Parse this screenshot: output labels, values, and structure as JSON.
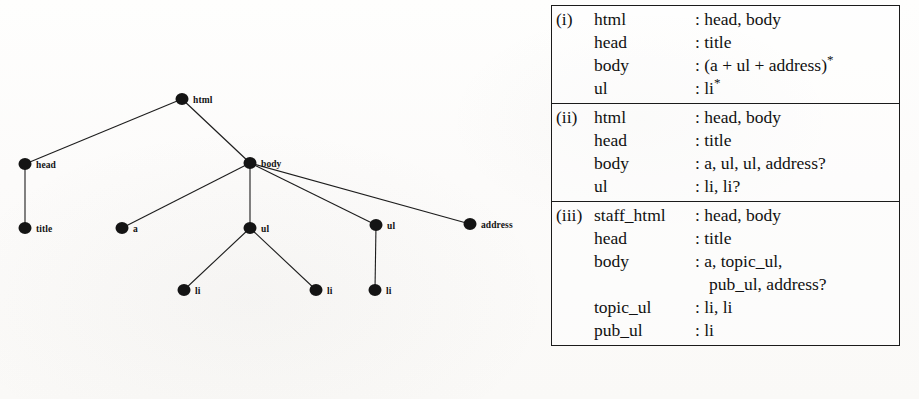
{
  "figure": {
    "tree": {
      "caption_nodes": "DOM tree for an HTML document",
      "nodes": [
        {
          "id": "html",
          "label": "html",
          "x": 182,
          "y": 99,
          "label_dx": 11,
          "label_dy": -4
        },
        {
          "id": "head",
          "label": "head",
          "x": 25,
          "y": 164,
          "label_dx": 11,
          "label_dy": -4
        },
        {
          "id": "body",
          "label": "body",
          "x": 250,
          "y": 163,
          "label_dx": 11,
          "label_dy": -4
        },
        {
          "id": "title",
          "label": "title",
          "x": 25,
          "y": 228,
          "label_dx": 11,
          "label_dy": -4
        },
        {
          "id": "a",
          "label": "a",
          "x": 122,
          "y": 228,
          "label_dx": 11,
          "label_dy": -4
        },
        {
          "id": "ul1",
          "label": "ul",
          "x": 250,
          "y": 228,
          "label_dx": 11,
          "label_dy": -4
        },
        {
          "id": "ul2",
          "label": "ul",
          "x": 376,
          "y": 225,
          "label_dx": 11,
          "label_dy": -4
        },
        {
          "id": "address",
          "label": "address",
          "x": 470,
          "y": 224,
          "label_dx": 11,
          "label_dy": -4
        },
        {
          "id": "li1",
          "label": "li",
          "x": 184,
          "y": 290,
          "label_dx": 11,
          "label_dy": -4
        },
        {
          "id": "li2",
          "label": "li",
          "x": 316,
          "y": 290,
          "label_dx": 11,
          "label_dy": -4
        },
        {
          "id": "li3",
          "label": "li",
          "x": 375,
          "y": 290,
          "label_dx": 11,
          "label_dy": -4
        }
      ],
      "edges": [
        {
          "from": "html",
          "to": "head"
        },
        {
          "from": "html",
          "to": "body"
        },
        {
          "from": "head",
          "to": "title"
        },
        {
          "from": "body",
          "to": "a"
        },
        {
          "from": "body",
          "to": "ul1"
        },
        {
          "from": "body",
          "to": "ul2"
        },
        {
          "from": "body",
          "to": "address"
        },
        {
          "from": "ul1",
          "to": "li1"
        },
        {
          "from": "ul1",
          "to": "li2"
        },
        {
          "from": "ul2",
          "to": "li3"
        }
      ],
      "node_radius": 6.5,
      "node_color": "#141414",
      "edge_color": "#1d1d1d",
      "edge_width": 1.1
    },
    "grammar": {
      "sections": [
        {
          "number": "(i)",
          "rows": [
            {
              "num": "(i)",
              "name": "html",
              "value": "head, body"
            },
            {
              "num": "",
              "name": "head",
              "value": "title"
            },
            {
              "num": "",
              "name": "body",
              "value": "(a + ul + address)*"
            },
            {
              "num": "",
              "name": "ul",
              "value": "li*"
            }
          ]
        },
        {
          "number": "(ii)",
          "rows": [
            {
              "num": "(ii)",
              "name": "html",
              "value": "head, body"
            },
            {
              "num": "",
              "name": "head",
              "value": "title"
            },
            {
              "num": "",
              "name": "body",
              "value": "a, ul, ul, address?"
            },
            {
              "num": "",
              "name": "ul",
              "value": "li, li?"
            }
          ]
        },
        {
          "number": "(iii)",
          "rows": [
            {
              "num": "(iii)",
              "name": "staff_html",
              "value": "head, body"
            },
            {
              "num": "",
              "name": "head",
              "value": "title"
            },
            {
              "num": "",
              "name": "body",
              "value": "a, topic_ul,"
            },
            {
              "num": "",
              "name": "",
              "value": "pub_ul, address?",
              "continuation": true
            },
            {
              "num": "",
              "name": "topic_ul",
              "value": "li, li"
            },
            {
              "num": "",
              "name": "pub_ul",
              "value": "li"
            }
          ]
        }
      ],
      "colon": ":",
      "border_color": "#1b1b1b"
    }
  }
}
